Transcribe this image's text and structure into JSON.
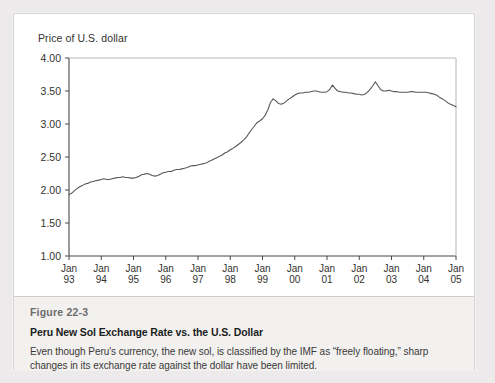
{
  "figure": {
    "number": "Figure 22-3",
    "title": "Peru New Sol Exchange Rate vs. the U.S. Dollar",
    "description": "Even though Peru's currency, the new sol, is classified by the IMF as “freely floating,” sharp changes in its exchange rate against the dollar have been limited."
  },
  "colors": {
    "page_background": "#eceaea",
    "card_background": "#ffffff",
    "caption_background": "#f2f1f0",
    "line": "#595755",
    "axis": "#4a4846",
    "text": "#33322f"
  },
  "chart_data": {
    "type": "line",
    "title": "",
    "subtitle": "",
    "xlabel": "",
    "ylabel": "Price of U.S. dollar",
    "ylim": [
      1.0,
      4.0
    ],
    "yticks": [
      1.0,
      1.5,
      2.0,
      2.5,
      3.0,
      3.5,
      4.0
    ],
    "ytick_labels": [
      "1.00",
      "1.50",
      "2.00",
      "2.50",
      "3.00",
      "3.50",
      "4.00"
    ],
    "grid": false,
    "legend": "none",
    "xtick_labels": [
      {
        "month": "Jan",
        "year": "93"
      },
      {
        "month": "Jan",
        "year": "94"
      },
      {
        "month": "Jan",
        "year": "95"
      },
      {
        "month": "Jan",
        "year": "96"
      },
      {
        "month": "Jan",
        "year": "97"
      },
      {
        "month": "Jan",
        "year": "98"
      },
      {
        "month": "Jan",
        "year": "99"
      },
      {
        "month": "Jan",
        "year": "00"
      },
      {
        "month": "Jan",
        "year": "01"
      },
      {
        "month": "Jan",
        "year": "02"
      },
      {
        "month": "Jan",
        "year": "03"
      },
      {
        "month": "Jan",
        "year": "04"
      },
      {
        "month": "Jan",
        "year": "05"
      }
    ],
    "x": [
      1993.0,
      1993.08,
      1993.17,
      1993.25,
      1993.33,
      1993.42,
      1993.5,
      1993.58,
      1993.67,
      1993.75,
      1993.83,
      1993.92,
      1994.0,
      1994.08,
      1994.17,
      1994.25,
      1994.33,
      1994.42,
      1994.5,
      1994.58,
      1994.67,
      1994.75,
      1994.83,
      1994.92,
      1995.0,
      1995.08,
      1995.17,
      1995.25,
      1995.33,
      1995.42,
      1995.5,
      1995.58,
      1995.67,
      1995.75,
      1995.83,
      1995.92,
      1996.0,
      1996.08,
      1996.17,
      1996.25,
      1996.33,
      1996.42,
      1996.5,
      1996.58,
      1996.67,
      1996.75,
      1996.83,
      1996.92,
      1997.0,
      1997.08,
      1997.17,
      1997.25,
      1997.33,
      1997.42,
      1997.5,
      1997.58,
      1997.67,
      1997.75,
      1997.83,
      1997.92,
      1998.0,
      1998.08,
      1998.17,
      1998.25,
      1998.33,
      1998.42,
      1998.5,
      1998.58,
      1998.67,
      1998.75,
      1998.83,
      1998.92,
      1999.0,
      1999.08,
      1999.17,
      1999.25,
      1999.33,
      1999.42,
      1999.5,
      1999.58,
      1999.67,
      1999.75,
      1999.83,
      1999.92,
      2000.0,
      2000.08,
      2000.17,
      2000.25,
      2000.33,
      2000.42,
      2000.5,
      2000.58,
      2000.67,
      2000.75,
      2000.83,
      2000.92,
      2001.0,
      2001.08,
      2001.17,
      2001.25,
      2001.33,
      2001.42,
      2001.5,
      2001.58,
      2001.67,
      2001.75,
      2001.83,
      2001.92,
      2002.0,
      2002.08,
      2002.17,
      2002.25,
      2002.33,
      2002.42,
      2002.5,
      2002.58,
      2002.67,
      2002.75,
      2002.83,
      2002.92,
      2003.0,
      2003.08,
      2003.17,
      2003.25,
      2003.33,
      2003.42,
      2003.5,
      2003.58,
      2003.67,
      2003.75,
      2003.83,
      2003.92,
      2004.0,
      2004.08,
      2004.17,
      2004.25,
      2004.33,
      2004.42,
      2004.5,
      2004.58,
      2004.67,
      2004.75,
      2004.83,
      2004.92,
      2005.0
    ],
    "values": [
      1.93,
      1.95,
      1.99,
      2.02,
      2.05,
      2.07,
      2.09,
      2.1,
      2.12,
      2.13,
      2.14,
      2.15,
      2.16,
      2.17,
      2.16,
      2.16,
      2.17,
      2.18,
      2.19,
      2.19,
      2.2,
      2.19,
      2.19,
      2.18,
      2.18,
      2.19,
      2.21,
      2.23,
      2.24,
      2.25,
      2.24,
      2.22,
      2.21,
      2.22,
      2.24,
      2.26,
      2.27,
      2.28,
      2.28,
      2.3,
      2.31,
      2.31,
      2.32,
      2.33,
      2.34,
      2.36,
      2.37,
      2.37,
      2.38,
      2.39,
      2.4,
      2.41,
      2.43,
      2.45,
      2.47,
      2.49,
      2.51,
      2.53,
      2.56,
      2.58,
      2.61,
      2.63,
      2.66,
      2.69,
      2.72,
      2.76,
      2.8,
      2.86,
      2.92,
      2.97,
      3.02,
      3.05,
      3.08,
      3.13,
      3.22,
      3.33,
      3.38,
      3.35,
      3.31,
      3.3,
      3.32,
      3.35,
      3.38,
      3.41,
      3.44,
      3.46,
      3.47,
      3.47,
      3.48,
      3.48,
      3.49,
      3.5,
      3.5,
      3.49,
      3.48,
      3.48,
      3.49,
      3.52,
      3.59,
      3.54,
      3.5,
      3.49,
      3.48,
      3.48,
      3.47,
      3.47,
      3.46,
      3.45,
      3.45,
      3.44,
      3.45,
      3.48,
      3.52,
      3.58,
      3.64,
      3.58,
      3.52,
      3.5,
      3.5,
      3.51,
      3.5,
      3.49,
      3.49,
      3.48,
      3.48,
      3.48,
      3.48,
      3.49,
      3.49,
      3.48,
      3.48,
      3.48,
      3.48,
      3.48,
      3.47,
      3.46,
      3.45,
      3.43,
      3.4,
      3.38,
      3.35,
      3.32,
      3.3,
      3.28,
      3.26
    ]
  }
}
